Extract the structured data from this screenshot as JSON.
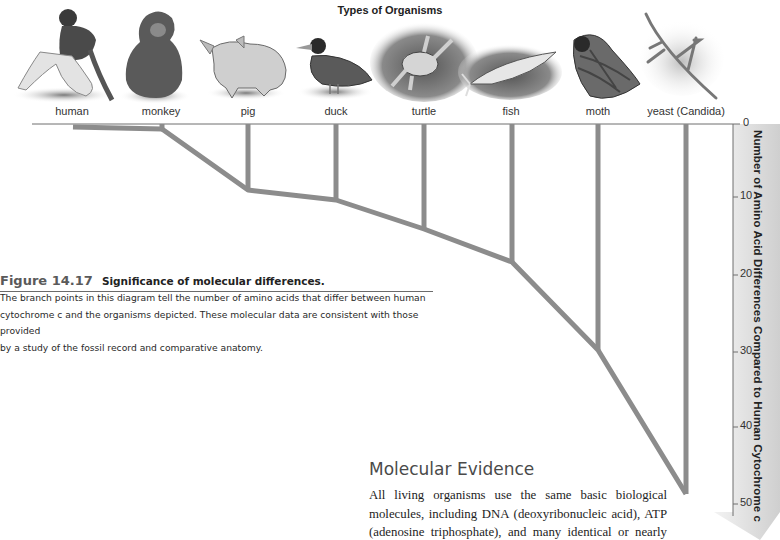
{
  "panel": {
    "title": "Types of Organisms"
  },
  "organisms": [
    {
      "name": "human",
      "icon": "human-figure",
      "label_x": 72,
      "differences": 0
    },
    {
      "name": "monkey",
      "icon": "monkey-figure",
      "label_x": 161,
      "differences": 1
    },
    {
      "name": "pig",
      "icon": "pig-figure",
      "label_x": 248,
      "differences": 9
    },
    {
      "name": "duck",
      "icon": "duck-figure",
      "label_x": 336,
      "differences": 11
    },
    {
      "name": "turtle",
      "icon": "turtle-figure",
      "label_x": 424,
      "differences": 15
    },
    {
      "name": "fish",
      "icon": "fish-figure",
      "label_x": 511,
      "differences": 19
    },
    {
      "name": "moth",
      "icon": "moth-figure",
      "label_x": 598,
      "differences": 30
    },
    {
      "name": "yeast (Candida)",
      "icon": "yeast-figure",
      "label_x": 686,
      "differences": 50
    }
  ],
  "axis": {
    "title": "Number of Amino Acid Differences Compared to Human Cytochrome c",
    "ticks": [
      "0",
      "10",
      "20",
      "30",
      "40",
      "50"
    ],
    "range": [
      0,
      50
    ]
  },
  "colors": {
    "tree_branch": "#8c8c8c",
    "axis_band": "#d9d9d9",
    "baseline": "#6e6e6e",
    "figure_number": "#5a5a5a"
  },
  "figure": {
    "number": "Figure 14.17",
    "title": "Significance of molecular differences.",
    "caption": "The branch points in this diagram tell the number of amino acids that differ between human cytochrome c and the organisms depicted. These molecular data are consistent with those provided by a study of the fossil record and comparative anatomy.",
    "caption_lines": [
      "The branch points in this diagram tell the number of amino acids that differ between human",
      "cytochrome c and the organisms depicted. These molecular data are consistent with those provided",
      "by a study of the fossil record and comparative anatomy."
    ]
  },
  "section": {
    "heading": "Molecular Evidence",
    "body_lines": [
      "All living organisms use the same basic biological",
      "molecules, including DNA (deoxyribonucleic acid), ATP",
      "(adenosine triphosphate), and many identical or nearly"
    ]
  }
}
